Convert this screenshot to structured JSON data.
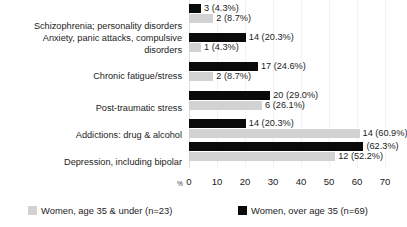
{
  "chart_data": {
    "type": "bar",
    "orientation": "horizontal",
    "title": "",
    "subtitle": "",
    "xlabel": "%",
    "ylabel": "",
    "xlim": [
      0,
      70
    ],
    "xticks": [
      0,
      10,
      20,
      30,
      40,
      50,
      60,
      70
    ],
    "xtick_labels": [
      "0",
      "10",
      "20",
      "30",
      "40",
      "50",
      "60",
      "70"
    ],
    "grid": true,
    "grid_axis": "x",
    "legend_position": "bottom",
    "categories": [
      "Schizophrenia; personality disorders",
      "Anxiety, panic attacks, compulsive\ndisorders",
      "Chronic fatigue/stress",
      "Post-traumatic stress",
      "Addictions: drug & alcohol",
      "Depression, including bipolar"
    ],
    "series": [
      {
        "name": "Women, over age 35 (n=69)",
        "color": "#0a0a0a",
        "values": [
          4.3,
          20.3,
          24.6,
          29.0,
          20.3,
          62.3
        ],
        "counts": [
          3,
          14,
          17,
          20,
          14,
          43
        ],
        "labels": [
          "3 (4.3%)",
          "14 (20.3%)",
          "17 (24.6%)",
          "20 (29.0%)",
          "14 (20.3%)",
          "(62.3%)"
        ]
      },
      {
        "name": "Women, age 35 & under (n=23)",
        "color": "#d2d2d2",
        "values": [
          8.7,
          4.3,
          8.7,
          26.1,
          60.9,
          52.2
        ],
        "counts": [
          2,
          1,
          2,
          6,
          14,
          12
        ],
        "labels": [
          "2 (8.7%)",
          "1 (4.3%)",
          "2 (8.7%)",
          "6 (26.1%)",
          "14 (60.9%)",
          "12 (52.2%)"
        ]
      }
    ]
  },
  "legend": {
    "items": [
      {
        "label": "Women, age 35 & under (n=23)",
        "color": "#d2d2d2"
      },
      {
        "label": "Women, over age 35 (n=69)",
        "color": "#0a0a0a"
      }
    ]
  },
  "axis": {
    "unit_symbol": "%"
  }
}
